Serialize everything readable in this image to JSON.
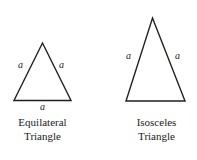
{
  "figure": {
    "background_color": "#ffffff",
    "stroke_color": "#231f20",
    "text_color": "#1a1a1a"
  },
  "shapes": [
    {
      "id": "equilateral",
      "name": "equilateral-triangle",
      "caption_line1": "Equilateral",
      "caption_line2": "Triangle",
      "points": "42.5,43 71,100.5 14,100.5",
      "stroke_width": 1.4,
      "labels": [
        {
          "text": "a",
          "name": "side-label-left",
          "x": 18,
          "y": 60
        },
        {
          "text": "a",
          "name": "side-label-right",
          "x": 59,
          "y": 60
        },
        {
          "text": "a",
          "name": "side-label-base",
          "x": 40,
          "y": 102
        }
      ],
      "caption_x": 7,
      "caption_y": 116,
      "caption_width": 71
    },
    {
      "id": "isosceles",
      "name": "isosceles-triangle",
      "caption_line1": "Isosceles",
      "caption_line2": "Triangle",
      "points": "152.5,18 185,101 126,101",
      "stroke_width": 1.4,
      "labels": [
        {
          "text": "a",
          "name": "side-label-left",
          "x": 126,
          "y": 51
        },
        {
          "text": "a",
          "name": "side-label-right",
          "x": 175,
          "y": 51
        }
      ],
      "caption_x": 121,
      "caption_y": 116,
      "caption_width": 71
    }
  ]
}
